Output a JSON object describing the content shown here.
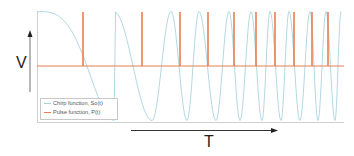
{
  "chart_data": {
    "type": "line",
    "title": "",
    "xlabel": "T",
    "ylabel": "V",
    "grid": false,
    "legend_position": "lower-left inside",
    "series": [
      {
        "name": "Chirp function, So(t)",
        "color": "#a8d4e0",
        "description": "Linear chirp (cosine with increasing frequency), starts at max amplitude, flat at start",
        "peaks_x_px": [
          37,
          114,
          171,
          199,
          229,
          251,
          270,
          289,
          310,
          326,
          341
        ],
        "troughs_x_px": [
          152,
          187,
          216,
          240,
          262,
          281,
          300,
          318,
          335
        ],
        "amplitude": 1
      },
      {
        "name": "Pulse function, P(t)",
        "color": "#e8804f",
        "description": "Narrow pulses at baseline 0, spiking to max at chirp zero-crossings",
        "pulse_x_px": [
          83,
          142,
          180,
          208,
          234,
          256,
          275,
          294,
          312,
          328
        ],
        "baseline": 0,
        "pulse_height": 1
      }
    ],
    "axis_arrows": {
      "y": "V (upward arrow)",
      "x": "T (rightward arrow)"
    }
  },
  "legend": {
    "items": [
      {
        "label": "Chirp function, So(t)",
        "color": "#a8d4e0"
      },
      {
        "label": "Pulse function, P(t)",
        "color": "#e8804f"
      }
    ]
  },
  "axes": {
    "y_label": "V",
    "x_label": "T"
  }
}
